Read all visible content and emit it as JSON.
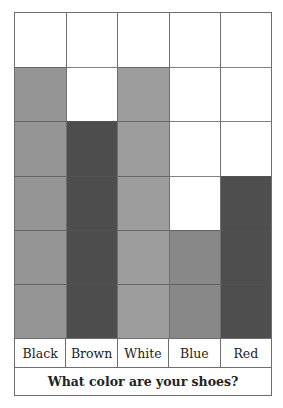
{
  "chart_data": {
    "type": "bar",
    "title": "What color are your shoes?",
    "categories": [
      "Black",
      "Brown",
      "White",
      "Blue",
      "Red"
    ],
    "values": [
      5,
      4,
      5,
      2,
      3
    ],
    "xlabel": "What color are your shoes?",
    "ylabel": "",
    "ylim": [
      0,
      6
    ],
    "grid": true,
    "style": "picture-graph-grid",
    "patterns": [
      "black",
      "brown",
      "white",
      "blue",
      "red"
    ]
  },
  "labels": {
    "cat0": "Black",
    "cat1": "Brown",
    "cat2": "White",
    "cat3": "Blue",
    "cat4": "Red"
  },
  "title": "What color are your shoes?"
}
